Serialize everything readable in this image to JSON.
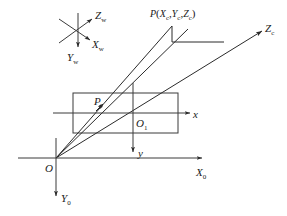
{
  "figure": {
    "background_color": "#ffffff",
    "line_color": "#3a3a3a",
    "text_color": "#1a1a1a"
  },
  "labels": {
    "world_z": "Z",
    "world_z_sub": "w",
    "world_x": "X",
    "world_x_sub": "w",
    "world_y": "Y",
    "world_y_sub": "w",
    "scene_point": "P",
    "scene_point_open": "(",
    "scene_point_xc": "X",
    "scene_point_xc_sub": "c",
    "scene_point_comma1": ",",
    "scene_point_yc": "Y",
    "scene_point_yc_sub": "c",
    "scene_point_comma2": ",",
    "scene_point_zc": "Z",
    "scene_point_zc_sub": "c",
    "scene_point_close": ")",
    "camera_z": "Z",
    "camera_z_sub": "c",
    "image_point": "P",
    "image_origin": "O",
    "image_origin_sub": "1",
    "image_x": "x",
    "image_y": "y",
    "camera_origin": "O",
    "base_x": "X",
    "base_x_sub": "0",
    "base_y": "Y",
    "base_y_sub": "0"
  },
  "elements": {
    "world_axes_name": "world-coordinate-axes",
    "image_plane_name": "image-plane-rectangle",
    "projection_rays_name": "projection-rays",
    "camera_axes_name": "camera-coordinate-axes"
  }
}
